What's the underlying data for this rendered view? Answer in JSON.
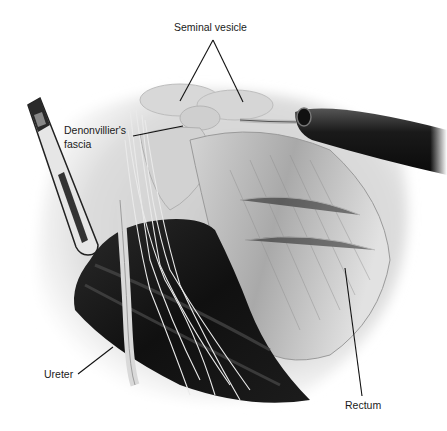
{
  "figure": {
    "type": "surgical illustration",
    "style": "grayscale"
  },
  "labels": {
    "seminal_vesicle": "Seminal vesicle",
    "denonvilliers_line1": "Denonvillier's",
    "denonvilliers_line2": "fascia",
    "ureter": "Ureter",
    "rectum": "Rectum"
  },
  "structures": [
    "seminal-vesicle",
    "denonvilliers-fascia",
    "ureter",
    "rectum",
    "nerve-fibers",
    "retractor-instrument",
    "laparoscopic-instrument",
    "pelvic-vessels"
  ]
}
